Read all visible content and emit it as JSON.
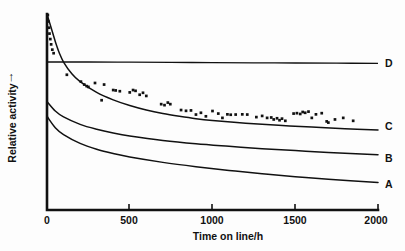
{
  "chart_data": {
    "type": "line",
    "title": "",
    "xlabel": "Time on line/h",
    "ylabel": "Relative activity",
    "ylabel_arrow": "↑",
    "xlim": [
      0,
      2000
    ],
    "ylim": [
      0,
      1
    ],
    "xticks": [
      0,
      500,
      1000,
      1500,
      2000
    ],
    "xticklabels": [
      "0",
      "500",
      "1000",
      "1500",
      "2000"
    ],
    "yticks": [],
    "yticklabels": [],
    "grid": false,
    "legend_position": "right-inline",
    "series": [
      {
        "name": "D",
        "label": "D",
        "kind": "line",
        "description": "flat horizontal reference line, no deactivation",
        "x": [
          0,
          250,
          500,
          750,
          1000,
          1250,
          1500,
          1750,
          2000
        ],
        "values": [
          0.755,
          0.755,
          0.754,
          0.753,
          0.752,
          0.751,
          0.75,
          0.749,
          0.748
        ]
      },
      {
        "name": "C",
        "label": "C",
        "kind": "line",
        "description": "steep initial exponential decay then plateau; fitted to scatter data",
        "x": [
          0,
          25,
          50,
          75,
          100,
          150,
          200,
          300,
          400,
          500,
          600,
          700,
          800,
          900,
          1000,
          1200,
          1400,
          1600,
          1800,
          2000
        ],
        "values": [
          1.0,
          0.93,
          0.86,
          0.8,
          0.755,
          0.695,
          0.655,
          0.6,
          0.562,
          0.533,
          0.51,
          0.492,
          0.478,
          0.466,
          0.457,
          0.443,
          0.432,
          0.423,
          0.415,
          0.408
        ]
      },
      {
        "name": "B",
        "label": "B",
        "kind": "line",
        "description": "moderate decay, intermediate stability",
        "x": [
          0,
          50,
          100,
          200,
          300,
          400,
          500,
          700,
          900,
          1100,
          1300,
          1500,
          1700,
          2000
        ],
        "values": [
          0.553,
          0.505,
          0.475,
          0.437,
          0.412,
          0.393,
          0.378,
          0.355,
          0.338,
          0.325,
          0.313,
          0.303,
          0.294,
          0.282
        ]
      },
      {
        "name": "A",
        "label": "A",
        "kind": "line",
        "description": "fastest continuous decay, least stable",
        "x": [
          0,
          50,
          100,
          200,
          300,
          400,
          500,
          700,
          900,
          1100,
          1300,
          1500,
          1700,
          2000
        ],
        "values": [
          0.478,
          0.42,
          0.385,
          0.34,
          0.31,
          0.288,
          0.27,
          0.243,
          0.221,
          0.202,
          0.185,
          0.17,
          0.157,
          0.14
        ]
      }
    ],
    "scatter": {
      "name": "C-measurements",
      "marker": "filled-square",
      "points": [
        [
          5,
          0.995
        ],
        [
          8,
          0.962
        ],
        [
          12,
          0.93
        ],
        [
          15,
          0.9
        ],
        [
          20,
          0.872
        ],
        [
          25,
          0.845
        ],
        [
          32,
          0.818
        ],
        [
          40,
          0.8
        ],
        [
          120,
          0.69
        ],
        [
          205,
          0.655
        ],
        [
          225,
          0.64
        ],
        [
          240,
          0.632
        ],
        [
          250,
          0.628
        ],
        [
          290,
          0.648
        ],
        [
          330,
          0.56
        ],
        [
          345,
          0.64
        ],
        [
          400,
          0.612
        ],
        [
          415,
          0.61
        ],
        [
          440,
          0.606
        ],
        [
          500,
          0.6
        ],
        [
          520,
          0.612
        ],
        [
          535,
          0.608
        ],
        [
          560,
          0.588
        ],
        [
          580,
          0.598
        ],
        [
          600,
          0.582
        ],
        [
          690,
          0.54
        ],
        [
          710,
          0.535
        ],
        [
          730,
          0.548
        ],
        [
          745,
          0.54
        ],
        [
          810,
          0.51
        ],
        [
          840,
          0.506
        ],
        [
          870,
          0.508
        ],
        [
          900,
          0.487
        ],
        [
          930,
          0.496
        ],
        [
          960,
          0.478
        ],
        [
          1000,
          0.505
        ],
        [
          1035,
          0.492
        ],
        [
          1060,
          0.47
        ],
        [
          1090,
          0.488
        ],
        [
          1110,
          0.486
        ],
        [
          1140,
          0.487
        ],
        [
          1180,
          0.488
        ],
        [
          1210,
          0.487
        ],
        [
          1265,
          0.474
        ],
        [
          1300,
          0.48
        ],
        [
          1330,
          0.47
        ],
        [
          1355,
          0.472
        ],
        [
          1370,
          0.462
        ],
        [
          1390,
          0.468
        ],
        [
          1405,
          0.458
        ],
        [
          1420,
          0.466
        ],
        [
          1440,
          0.455
        ],
        [
          1490,
          0.492
        ],
        [
          1510,
          0.494
        ],
        [
          1530,
          0.49
        ],
        [
          1545,
          0.5
        ],
        [
          1560,
          0.496
        ],
        [
          1580,
          0.502
        ],
        [
          1600,
          0.47
        ],
        [
          1625,
          0.488
        ],
        [
          1660,
          0.494
        ],
        [
          1690,
          0.452
        ],
        [
          1700,
          0.446
        ],
        [
          1740,
          0.462
        ],
        [
          1790,
          0.47
        ],
        [
          1850,
          0.455
        ]
      ]
    }
  },
  "labels": {
    "series_A": "A",
    "series_B": "B",
    "series_C": "C",
    "series_D": "D"
  }
}
